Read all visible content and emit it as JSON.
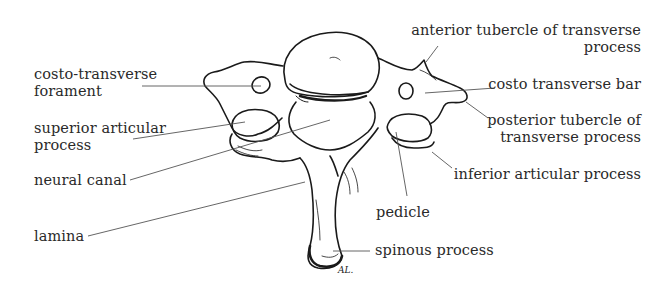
{
  "figure": {
    "signature": "AL."
  },
  "labels": {
    "costo_transverse_foramen": {
      "line1": "costo-transverse",
      "line2": "forament"
    },
    "superior_articular_process": {
      "line1": "superior articular",
      "line2": "process"
    },
    "neural_canal": {
      "line1": "neural canal"
    },
    "lamina": {
      "line1": "lamina"
    },
    "anterior_tubercle": {
      "line1": "anterior tubercle of transverse",
      "line2": "process"
    },
    "costo_transverse_bar": {
      "line1": "costo transverse bar"
    },
    "posterior_tubercle": {
      "line1": "posterior tubercle of",
      "line2": "transverse process"
    },
    "inferior_articular_process": {
      "line1": "inferior articular process"
    },
    "pedicle": {
      "line1": "pedicle"
    },
    "spinous_process": {
      "line1": "spinous process"
    }
  },
  "colors": {
    "ink": "#1a1a1a",
    "text": "#2a2a2a",
    "leader": "#555555",
    "background": "#ffffff"
  }
}
